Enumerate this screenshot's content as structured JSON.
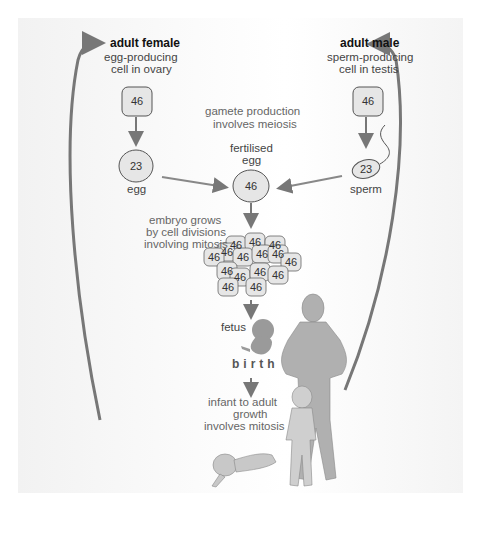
{
  "female": {
    "title": "adult female",
    "subtitle_line1": "egg-producing",
    "subtitle_line2": "cell in ovary",
    "cell_count": "46",
    "gamete_count": "23",
    "gamete_label": "egg"
  },
  "male": {
    "title": "adult male",
    "subtitle_line1": "sperm-producing",
    "subtitle_line2": "cell in testis",
    "cell_count": "46",
    "gamete_count": "23",
    "gamete_label": "sperm"
  },
  "meiosis_note": {
    "line1": "gamete production",
    "line2": "involves meiosis"
  },
  "zygote": {
    "line1": "fertilised",
    "line2": "egg",
    "count": "46"
  },
  "embryo_note": {
    "line1": "embryo grows",
    "line2": "by cell divisions",
    "line3": "involving mitosis"
  },
  "embryo_cells": [
    "46",
    "46",
    "46",
    "46",
    "46",
    "46",
    "46",
    "46",
    "46",
    "46",
    "46",
    "46",
    "46",
    "46",
    "46"
  ],
  "fetus_label": "fetus",
  "birth_label": "birth",
  "growth_note": {
    "line1": "infant to adult",
    "line2": "growth",
    "line3": "involves mitosis"
  },
  "colors": {
    "arrow": "#7a7a7a",
    "cell_fill": "#e6e6e6",
    "cell_stroke": "#555555",
    "figure_fill": "#a9a9a9"
  }
}
